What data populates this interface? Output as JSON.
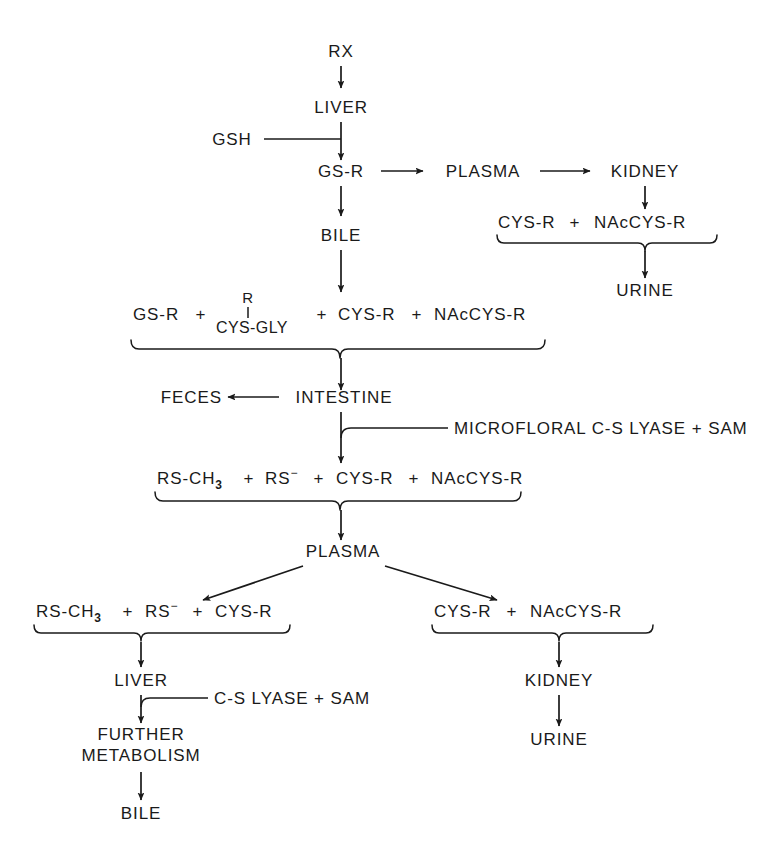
{
  "diagram": {
    "background_color": "#ffffff",
    "ink_color": "#1a1a1a",
    "nodes": {
      "rx": "RX",
      "liver_top": "LIVER",
      "gsh": "GSH",
      "gs_r": "GS-R",
      "plasma_top": "PLASMA",
      "kidney_top": "KIDNEY",
      "bile_top": "BILE",
      "urine_top": "URINE",
      "feces": "FECES",
      "intestine": "INTESTINE",
      "plasma_mid": "PLASMA",
      "liver_bottom": "LIVER",
      "further": "FURTHER",
      "metabolism": "METABOLISM",
      "bile_bottom": "BILE",
      "kidney_bottom": "KIDNEY",
      "urine_bottom": "URINE"
    },
    "enzymes": {
      "microfloral": "MICROFLORAL C-S LYASE + SAM",
      "liver_lyase": "C-S LYASE + SAM"
    },
    "groups": {
      "kidney_metabolites": {
        "cys_r": "CYS-R",
        "plus": "+",
        "nac_cys_r": "NAcCYS-R"
      },
      "bile_metabolites": {
        "gs_r": "GS-R",
        "plus1": "+",
        "r_substituent": "R",
        "cys_gly": "CYS-GLY",
        "plus2": "+",
        "cys_r": "CYS-R",
        "plus3": "+",
        "nac_cys_r": "NAcCYS-R"
      },
      "intestinal_metabolites": {
        "rs_ch3_base": "RS-CH",
        "rs_ch3_sub": "3",
        "plus1": "+",
        "rs_base": "RS",
        "rs_sup": "−",
        "plus2": "+",
        "cys_r": "CYS-R",
        "plus3": "+",
        "nac_cys_r": "NAcCYS-R"
      },
      "plasma_left_metabolites": {
        "rs_ch3_base": "RS-CH",
        "rs_ch3_sub": "3",
        "plus1": "+",
        "rs_base": "RS",
        "rs_sup": "−",
        "plus2": "+",
        "cys_r": "CYS-R"
      },
      "plasma_right_metabolites": {
        "cys_r": "CYS-R",
        "plus": "+",
        "nac_cys_r": "NAcCYS-R"
      }
    }
  }
}
